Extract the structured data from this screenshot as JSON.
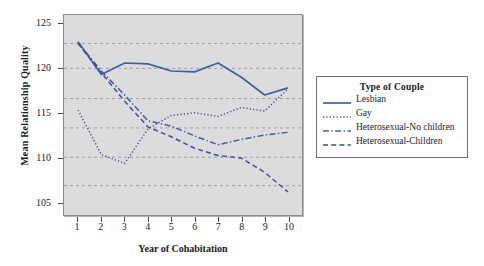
{
  "chart_data": {
    "type": "line",
    "title": "",
    "xlabel": "Year of Cohabitation",
    "ylabel": "Mean Relationship Quality",
    "x": [
      1,
      2,
      3,
      4,
      5,
      6,
      7,
      8,
      9,
      10
    ],
    "xticklabels": [
      "1",
      "2",
      "3",
      "4",
      "5",
      "6",
      "7",
      "8",
      "9",
      "10"
    ],
    "yticklabels": [
      "105",
      "110",
      "115",
      "120",
      "125"
    ],
    "yticks": [
      105,
      110,
      115,
      120,
      125
    ],
    "ylim": [
      103.5,
      126.0
    ],
    "xlim": [
      0.4,
      10.6
    ],
    "grid": true,
    "gridlines": [
      106.8,
      110.0,
      113.3,
      116.6,
      120.0,
      122.8
    ],
    "legend_position": "right-outside",
    "legend_title": "Type of Couple",
    "series": [
      {
        "name": "Lesbian",
        "style": "solid",
        "color": "#3f5fa8",
        "values": [
          123.0,
          119.3,
          120.6,
          120.5,
          119.7,
          119.6,
          120.6,
          119.0,
          117.0,
          117.8
        ]
      },
      {
        "name": "Gay",
        "style": "dotted",
        "color": "#3f4f9b",
        "values": [
          115.3,
          110.3,
          109.3,
          113.2,
          114.7,
          115.0,
          114.6,
          115.6,
          115.2,
          117.7
        ]
      },
      {
        "name": "Heterosexual-No children",
        "style": "dashdot",
        "color": "#3f5fa8",
        "values": [
          122.9,
          119.7,
          117.0,
          114.1,
          113.5,
          112.4,
          111.4,
          112.0,
          112.5,
          112.8
        ]
      },
      {
        "name": "Heterosexual-Children",
        "style": "dashed",
        "color": "#3f4f9b",
        "values": [
          122.8,
          119.5,
          116.3,
          113.4,
          112.3,
          111.0,
          110.2,
          109.9,
          108.3,
          106.1
        ]
      }
    ]
  },
  "axes": {
    "ytick_labels": [
      "125",
      "120",
      "115",
      "110",
      "105"
    ],
    "xtick_labels": [
      "1",
      "2",
      "3",
      "4",
      "5",
      "6",
      "7",
      "8",
      "9",
      "10"
    ],
    "y_axis_title": "Mean Relationship Quality",
    "x_axis_title": "Year of Cohabitation"
  },
  "legend": {
    "title": "Type of Couple",
    "entries": [
      {
        "label": "Lesbian",
        "style": "solid"
      },
      {
        "label": "Gay",
        "style": "dotted"
      },
      {
        "label": "Heterosexual-No children",
        "style": "dashdot"
      },
      {
        "label": "Heterosexual-Children",
        "style": "dashed"
      }
    ]
  },
  "colors": {
    "plot_background": "#dcdcdc",
    "page_background": "#ffffff",
    "line_blue": "#3f5fa8",
    "grid": "#8e8e9c",
    "axis": "#4a4a4a"
  }
}
